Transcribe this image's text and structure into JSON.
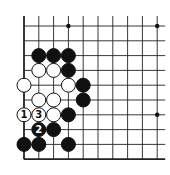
{
  "board": {
    "origin_x": 24,
    "origin_y": 26,
    "spacing": 14.8,
    "cols": 10,
    "rows": 10,
    "line_extend_right": 8,
    "line_color": "#222222",
    "stone_radius": 7,
    "edges": [
      "left",
      "bottom"
    ]
  },
  "star_points": [
    {
      "col": 3,
      "row": 0
    },
    {
      "col": 9,
      "row": 0
    },
    {
      "col": 9,
      "row": 6
    }
  ],
  "stones": [
    {
      "col": 1,
      "row": 2,
      "color": "black"
    },
    {
      "col": 2,
      "row": 2,
      "color": "black"
    },
    {
      "col": 3,
      "row": 2,
      "color": "black"
    },
    {
      "col": 1,
      "row": 3,
      "color": "white"
    },
    {
      "col": 2,
      "row": 3,
      "color": "white"
    },
    {
      "col": 3,
      "row": 3,
      "color": "black"
    },
    {
      "col": 0,
      "row": 4,
      "color": "white"
    },
    {
      "col": 3,
      "row": 4,
      "color": "white"
    },
    {
      "col": 4,
      "row": 4,
      "color": "black"
    },
    {
      "col": 1,
      "row": 5,
      "color": "white"
    },
    {
      "col": 2,
      "row": 5,
      "color": "white"
    },
    {
      "col": 4,
      "row": 5,
      "color": "black"
    },
    {
      "col": 0,
      "row": 6,
      "color": "white",
      "label": "1"
    },
    {
      "col": 1,
      "row": 6,
      "color": "white",
      "label": "3"
    },
    {
      "col": 2,
      "row": 6,
      "color": "white"
    },
    {
      "col": 3,
      "row": 6,
      "color": "black"
    },
    {
      "col": 1,
      "row": 7,
      "color": "black",
      "label": "2"
    },
    {
      "col": 2,
      "row": 7,
      "color": "black"
    },
    {
      "col": 0,
      "row": 8,
      "color": "black"
    },
    {
      "col": 1,
      "row": 8,
      "color": "black"
    },
    {
      "col": 3,
      "row": 8,
      "color": "black"
    }
  ]
}
